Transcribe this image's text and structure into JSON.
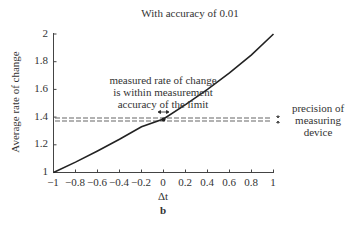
{
  "chart_data": {
    "type": "line",
    "title": "With accuracy of 0.01",
    "xlabel": "Δt",
    "ylabel": "Average rate of change",
    "subfigure_label": "b",
    "xlim": [
      -1,
      1
    ],
    "ylim": [
      1,
      2
    ],
    "x_ticks": [
      "-1",
      "-0.8",
      "-0.6",
      "-0.4",
      "-0.2",
      "0",
      "0.2",
      "0.4",
      "0.6",
      "0.8",
      "1"
    ],
    "y_ticks": [
      "1",
      "1.2",
      "1.4",
      "1.6",
      "1.8",
      "2"
    ],
    "grid": false,
    "series": [
      {
        "name": "average rate of change",
        "style": "solid",
        "color": "#222222",
        "x": [
          -1,
          -0.8,
          -0.6,
          -0.4,
          -0.2,
          0,
          0.2,
          0.4,
          0.6,
          0.8,
          1
        ],
        "y": [
          1.0,
          1.075,
          1.155,
          1.24,
          1.33,
          1.386,
          1.49,
          1.6,
          1.72,
          1.85,
          2.0
        ]
      },
      {
        "name": "upper precision bound",
        "style": "dashed",
        "color": "#555555",
        "x": [
          -1,
          1
        ],
        "y": [
          1.39,
          1.39
        ]
      },
      {
        "name": "lower precision bound",
        "style": "dashed",
        "color": "#555555",
        "x": [
          -1,
          1
        ],
        "y": [
          1.37,
          1.37
        ]
      }
    ],
    "annotations": [
      {
        "text_lines": [
          "measured rate of change",
          "is within measurement",
          "accuracy of the limit"
        ],
        "x": 0,
        "y": 1.386
      },
      {
        "text_lines": [
          "precision of",
          "measuring",
          "device"
        ],
        "position": "right of dashed lines"
      }
    ],
    "legend": "none"
  },
  "labels": {
    "title": "With accuracy of 0.01",
    "ylabel": "Average rate of change",
    "xlabel": "Δt",
    "sub": "b",
    "annotation": [
      "measured rate of change",
      "is within measurement",
      "accuracy of the limit"
    ],
    "precision": [
      "precision of",
      "measuring",
      "device"
    ],
    "yticks": [
      "2",
      "1.8",
      "1.6",
      "1.4",
      "1.2",
      "1"
    ],
    "xticks": [
      "−1",
      "−0.8",
      "−0.6",
      "−0.4",
      "−0.2",
      "0",
      "0.2",
      "0.4",
      "0.6",
      "0.8",
      "1"
    ]
  }
}
